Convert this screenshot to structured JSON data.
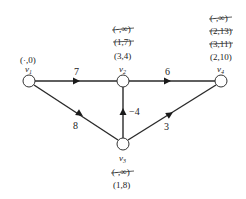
{
  "diagram": {
    "type": "weighted directed graph (Bellman-Ford style labeling)",
    "nodes": [
      {
        "id": "v1",
        "name": "v",
        "sub": "1",
        "x": 29,
        "y": 81,
        "labels": [
          {
            "text": "(·,0)",
            "crossed": false
          }
        ]
      },
      {
        "id": "v2",
        "name": "v",
        "sub": "2",
        "x": 123,
        "y": 81,
        "labels": [
          {
            "text": "(-,∞)",
            "crossed": true
          },
          {
            "text": "(1,7)",
            "crossed": true
          },
          {
            "text": "(3,4)",
            "crossed": false
          }
        ]
      },
      {
        "id": "v3",
        "name": "v",
        "sub": "3",
        "x": 123,
        "y": 144,
        "labels": [
          {
            "text": "(-,∞)",
            "crossed": true
          },
          {
            "text": "(1,8)",
            "crossed": false
          }
        ]
      },
      {
        "id": "v4",
        "name": "v",
        "sub": "4",
        "x": 221,
        "y": 81,
        "labels": [
          {
            "text": "(-,∞)",
            "crossed": true
          },
          {
            "text": "(2,13)",
            "crossed": true
          },
          {
            "text": "(3,11)",
            "crossed": true
          },
          {
            "text": "(2,10)",
            "crossed": false
          }
        ]
      }
    ],
    "edges": [
      {
        "from": "v1",
        "to": "v2",
        "weight": "7"
      },
      {
        "from": "v2",
        "to": "v4",
        "weight": "6"
      },
      {
        "from": "v1",
        "to": "v3",
        "weight": "8"
      },
      {
        "from": "v3",
        "to": "v2",
        "weight": "−4"
      },
      {
        "from": "v3",
        "to": "v4",
        "weight": "3"
      }
    ]
  }
}
